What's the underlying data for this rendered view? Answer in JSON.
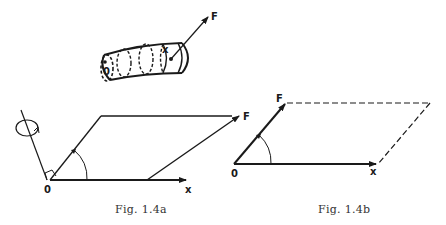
{
  "figure_a": {
    "caption": "Fig. 1.4a",
    "tube": {
      "origin_label": "0",
      "point_label": "x",
      "force_label": "F"
    },
    "parallelogram": {
      "origin_label": "0",
      "x_label": "x",
      "force_label": "F"
    }
  },
  "figure_b": {
    "caption": "Fig. 1.4b",
    "origin_label": "0",
    "x_label": "x",
    "force_label": "F"
  },
  "colors": {
    "ink": "#1a1a1a",
    "background": "#ffffff"
  }
}
